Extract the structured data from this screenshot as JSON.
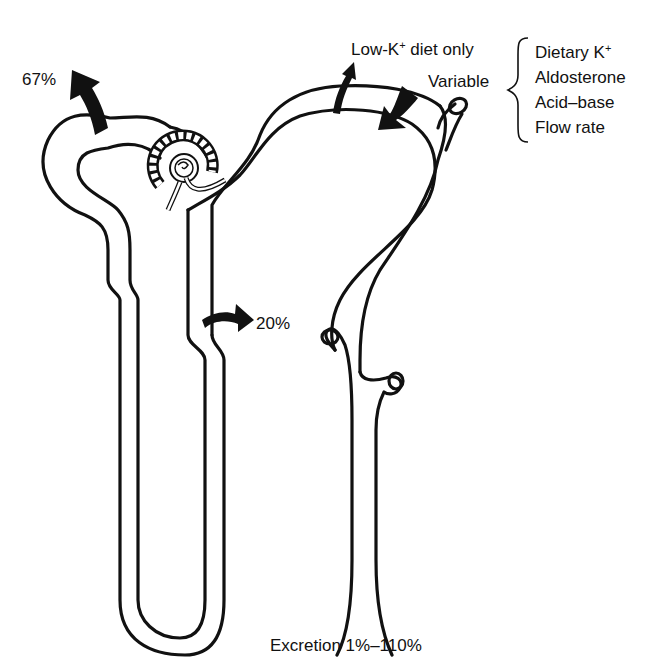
{
  "diagram": {
    "labels": {
      "proximal_reabsorption": "67%",
      "loop_reabsorption": "20%",
      "collecting_reabsorption": "Low-K",
      "collecting_reabsorption_sup": "+",
      "collecting_reabsorption_suffix": " diet only",
      "distal_secretion": "Variable",
      "excretion": "Excretion 1%–110%"
    },
    "regulators": [
      {
        "label": "Dietary K",
        "sup": "+"
      },
      {
        "label": "Aldosterone",
        "sup": ""
      },
      {
        "label": "Acid–base",
        "sup": ""
      },
      {
        "label": "Flow rate",
        "sup": ""
      }
    ],
    "structures": [
      "glomerulus",
      "proximal-tubule",
      "loop-of-henle",
      "distal-tubule",
      "collecting-duct"
    ],
    "colors": {
      "line": "#111111",
      "background": "#ffffff"
    }
  }
}
